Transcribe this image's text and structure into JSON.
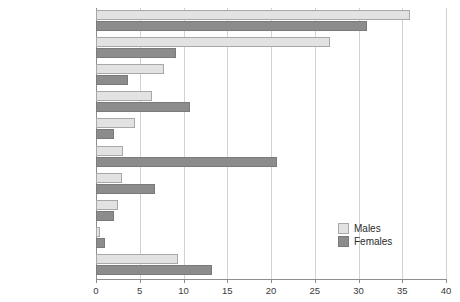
{
  "chart_data": {
    "type": "bar",
    "orientation": "horizontal",
    "title": "",
    "subtitle": "",
    "xlabel": "",
    "ylabel": "",
    "xlim": [
      0,
      40
    ],
    "xticks": [
      0,
      5,
      10,
      15,
      20,
      25,
      30,
      35,
      40
    ],
    "xtick_labels": [
      "0",
      "5",
      "10",
      "15",
      "20",
      "25",
      "30",
      "35",
      "40"
    ],
    "grid": "vertical",
    "legend_position": "bottom-right",
    "categories": [
      "Sharp instrument",
      "Hitting, kicking etc.",
      "Shooting",
      "Blunt instrument",
      "Motor vehicle",
      "Strangulation",
      "Burning",
      "Poison or drugs",
      "Drowning",
      "Other"
    ],
    "category_superscripts": [
      "",
      "",
      "",
      "",
      "1",
      "2",
      "",
      "",
      "",
      "3"
    ],
    "series": [
      {
        "name": "Males",
        "color": "#e2e2e2",
        "values": [
          35.9,
          26.7,
          7.8,
          6.4,
          4.5,
          3.1,
          3.0,
          2.5,
          0.5,
          9.4
        ]
      },
      {
        "name": "Females",
        "color": "#8c8c8c",
        "values": [
          31.0,
          9.1,
          3.7,
          10.7,
          2.0,
          20.7,
          6.7,
          2.0,
          1.0,
          13.2
        ]
      }
    ]
  },
  "legend": {
    "items": [
      {
        "label": "Males",
        "swatch": "males"
      },
      {
        "label": "Females",
        "swatch": "females"
      }
    ]
  }
}
